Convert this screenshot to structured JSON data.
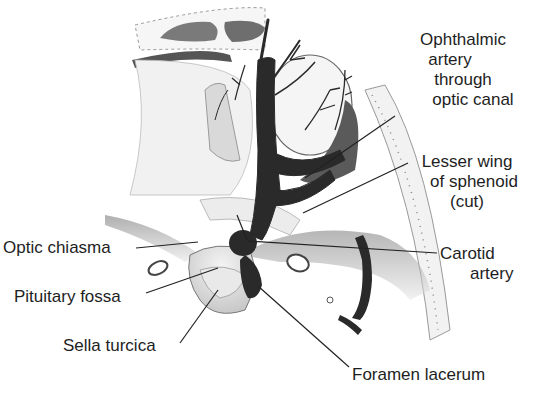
{
  "diagram": {
    "labels": {
      "ophthalmic_artery": [
        "Ophthalmic",
        "artery",
        "through",
        "optic canal"
      ],
      "lesser_wing": [
        "Lesser wing",
        "of sphenoid",
        "(cut)"
      ],
      "carotid_artery": [
        "Carotid",
        "artery"
      ],
      "optic_chiasma": "Optic chiasma",
      "pituitary_fossa": "Pituitary fossa",
      "sella_turcica": "Sella turcica",
      "foramen_lacerum": "Foramen lacerum"
    },
    "colors": {
      "artery": "#2a2a2a",
      "bone_shade": "#9a9a9a",
      "line": "#222222",
      "text": "#1e1e1e"
    }
  }
}
